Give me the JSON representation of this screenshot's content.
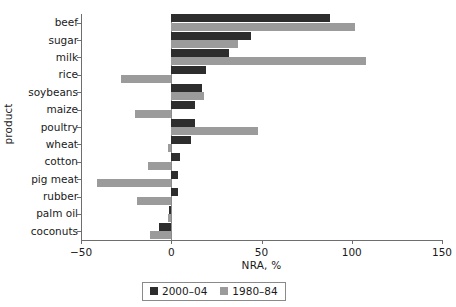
{
  "chart_data": {
    "type": "bar",
    "orientation": "horizontal",
    "title": "",
    "xlabel": "NRA, %",
    "ylabel": "product",
    "xlim": [
      -50,
      150
    ],
    "xticks": [
      -50,
      0,
      50,
      100,
      150
    ],
    "xticklabels": [
      "−50",
      "0",
      "50",
      "100",
      "150"
    ],
    "grid": false,
    "legend_position": "bottom-center",
    "categories": [
      "beef",
      "sugar",
      "milk",
      "rice",
      "soybeans",
      "maize",
      "poultry",
      "wheat",
      "cotton",
      "pig meat",
      "rubber",
      "palm oil",
      "coconuts"
    ],
    "series": [
      {
        "name": "2000–04",
        "color": "#2d2d2d",
        "values": [
          88,
          44,
          32,
          19,
          17,
          13,
          13,
          11,
          5,
          4,
          4,
          -1,
          -7
        ]
      },
      {
        "name": "1980–84",
        "color": "#9b9b9b",
        "values": [
          102,
          37,
          108,
          -28,
          18,
          -20,
          48,
          -2,
          -13,
          -41,
          -19,
          -2,
          -12
        ]
      }
    ]
  },
  "legend": {
    "entries": [
      {
        "label": "2000–04",
        "swatch": "dark"
      },
      {
        "label": "1980–84",
        "swatch": "light"
      }
    ]
  }
}
